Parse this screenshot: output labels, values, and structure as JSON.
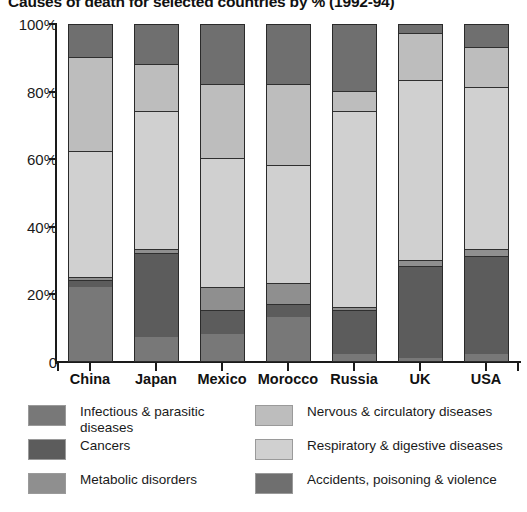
{
  "chart_data": {
    "type": "bar",
    "subtype": "stacked-percentage-column",
    "title": "Causes of death for selected countries by % (1992-94)",
    "xlabel": "",
    "ylabel": "",
    "ylim": [
      0,
      100
    ],
    "ytick_labels": [
      "100%",
      "80%",
      "60%",
      "40%",
      "20%",
      "0"
    ],
    "ytick_values": [
      100,
      80,
      60,
      40,
      20,
      0
    ],
    "grid": false,
    "legend_position": "bottom",
    "categories": [
      "China",
      "Japan",
      "Mexico",
      "Morocco",
      "Russia",
      "UK",
      "USA"
    ],
    "series": [
      {
        "name": "Infectious & parasitic diseases",
        "color": "#787878",
        "values": [
          22,
          7,
          8,
          13,
          2,
          1,
          2
        ]
      },
      {
        "name": "Cancers",
        "color": "#5c5c5c",
        "values": [
          2,
          25,
          7,
          4,
          13,
          27,
          29
        ]
      },
      {
        "name": "Metabolic disorders",
        "color": "#8f8f8f",
        "values": [
          1,
          1,
          7,
          6,
          1,
          2,
          2
        ]
      },
      {
        "name": "Respiratory & digestive diseases",
        "color": "#d0d0d0",
        "values": [
          37,
          41,
          38,
          35,
          58,
          53,
          48
        ]
      },
      {
        "name": "Nervous & circulatory diseases",
        "color": "#bdbdbd",
        "values": [
          28,
          14,
          22,
          24,
          6,
          14,
          12
        ]
      },
      {
        "name": "Accidents, poisoning & violence",
        "color": "#6f6f6f",
        "values": [
          10,
          12,
          18,
          18,
          20,
          3,
          7
        ]
      }
    ]
  },
  "legend": {
    "left_column": [
      {
        "label": "Infectious & parasitic diseases",
        "color": "#787878"
      },
      {
        "label": "Cancers",
        "color": "#5c5c5c"
      },
      {
        "label": "Metabolic disorders",
        "color": "#8f8f8f"
      }
    ],
    "right_column": [
      {
        "label": "Nervous & circulatory diseases",
        "color": "#bdbdbd"
      },
      {
        "label": "Respiratory & digestive diseases",
        "color": "#d0d0d0"
      },
      {
        "label": "Accidents, poisoning & violence",
        "color": "#6f6f6f"
      }
    ]
  }
}
